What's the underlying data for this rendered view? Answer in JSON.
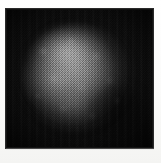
{
  "plate": {
    "kind": "grayscale-micrograph",
    "caption": "",
    "label": "",
    "background_color": "#060606",
    "paper_color": "#fdfdfc",
    "border_color": "#2a2a2a",
    "frame": {
      "left_px": 6,
      "top_px": 9,
      "width_px": 147,
      "height_px": 139
    },
    "texture": "halftone-dither",
    "subject": {
      "name": "luminous-blob",
      "shape": "irregular-round",
      "center_x_px": 76,
      "center_y_px": 82,
      "radius_px": 55,
      "brightest_region": "upper-center",
      "peak_gray": "#d0d0d0",
      "field_gray": "#0a0a0a"
    }
  },
  "annotations": {
    "axis_labels": [],
    "tick_labels": [],
    "legend": [],
    "scale_bar": "",
    "text_items": []
  }
}
